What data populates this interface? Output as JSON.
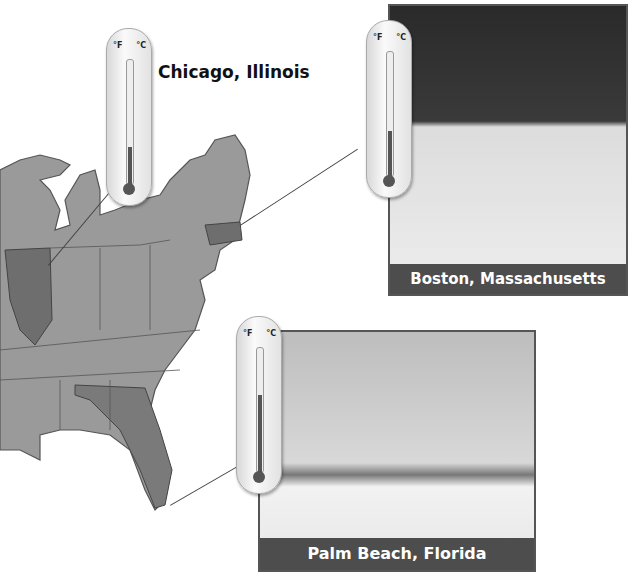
{
  "locations": [
    {
      "id": "chicago",
      "label": "Chicago, Illinois",
      "temperature_f": 20,
      "temperature_c": -7
    },
    {
      "id": "boston",
      "label": "Boston, Massachusetts",
      "temperature_f": 30,
      "temperature_c": -1,
      "photo": "people ice skating in a park"
    },
    {
      "id": "palm_beach",
      "label": "Palm Beach, Florida",
      "temperature_f": 65,
      "temperature_c": 18,
      "photo": "beach with palm trees"
    }
  ],
  "thermometer": {
    "unit_f": "°F",
    "unit_c": "°C",
    "f_ticks": [
      "110",
      "100",
      "90",
      "80",
      "70",
      "60",
      "50",
      "40",
      "30",
      "20",
      "10",
      "0",
      "-10"
    ],
    "c_ticks": [
      "40",
      "30",
      "20",
      "10",
      "0",
      "-10",
      "-20"
    ]
  },
  "map": {
    "description": "Eastern United States map",
    "highlighted_states": [
      "Illinois",
      "Massachusetts",
      "Florida"
    ]
  },
  "colors": {
    "caption_bg": "#4d4d4d",
    "caption_text": "#ffffff",
    "map_fill": "#9a9a9a",
    "highlight_fill": "#6e6e6e"
  }
}
